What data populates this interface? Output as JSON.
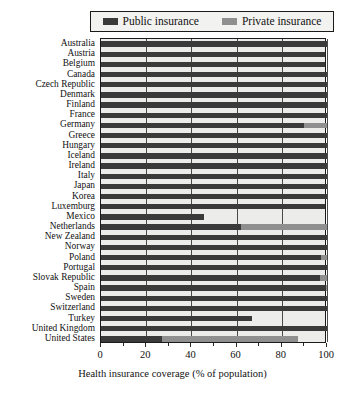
{
  "legend": {
    "entries": [
      {
        "label": "Public insurance",
        "key": "public",
        "color": "#3a3a3a",
        "swatch_name": "legend-swatch-public"
      },
      {
        "label": "Private insurance",
        "key": "private",
        "color": "#8f8f8f",
        "swatch_name": "legend-swatch-private"
      }
    ]
  },
  "axis": {
    "x_title": "Health insurance coverage (% of population)",
    "x_ticks": [
      "0",
      "20",
      "40",
      "60",
      "80",
      "100"
    ],
    "x_min": 0,
    "x_max": 100
  },
  "chart_data": {
    "type": "bar",
    "orientation": "horizontal",
    "stacked": true,
    "title": "",
    "xlabel": "Health insurance coverage (% of population)",
    "ylabel": "",
    "xlim": [
      0,
      100
    ],
    "xticks": [
      0,
      20,
      40,
      60,
      80,
      100
    ],
    "grid": "vertical",
    "legend_position": "top",
    "categories": [
      "Australia",
      "Austria",
      "Belgium",
      "Canada",
      "Czech Republic",
      "Denmark",
      "Finland",
      "France",
      "Germany",
      "Greece",
      "Hungary",
      "Iceland",
      "Ireland",
      "Italy",
      "Japan",
      "Korea",
      "Luxemburg",
      "Mexico",
      "Netherlands",
      "New Zealand",
      "Norway",
      "Poland",
      "Portugal",
      "Slovak Republic",
      "Spain",
      "Sweden",
      "Switzerland",
      "Turkey",
      "United Kingdom",
      "United States"
    ],
    "series": [
      {
        "name": "Public insurance",
        "color": "#3a3a3a",
        "values": [
          100,
          99,
          99,
          100,
          100,
          100,
          100,
          99.9,
          90,
          100,
          100,
          100,
          100,
          100,
          100,
          100,
          99,
          45.5,
          62,
          100,
          100,
          97.5,
          100,
          97,
          99.5,
          100,
          100,
          67,
          100,
          27
        ]
      },
      {
        "name": "Private insurance",
        "color": "#8f8f8f",
        "values": [
          0,
          0,
          0,
          0,
          0,
          0,
          0,
          0,
          10,
          0,
          0,
          0,
          0,
          0,
          0,
          0,
          0,
          0,
          38,
          0,
          0,
          2.5,
          0,
          3,
          0.5,
          0,
          0,
          0,
          0,
          60
        ]
      }
    ]
  }
}
